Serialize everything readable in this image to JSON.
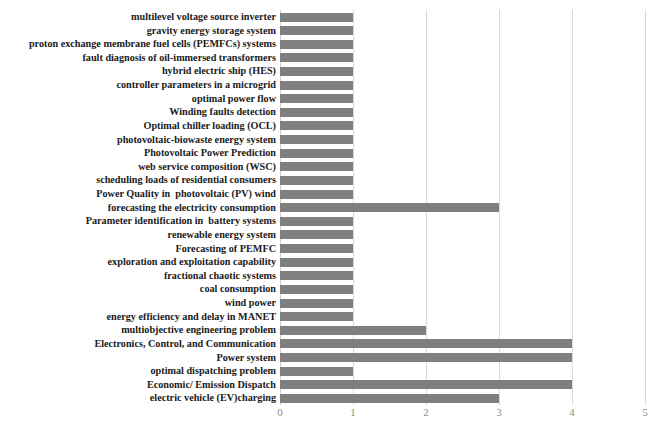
{
  "chart_data": {
    "type": "bar",
    "orientation": "horizontal",
    "title": "",
    "subtitle": "",
    "xlabel": "",
    "ylabel": "",
    "xlim": [
      0,
      5
    ],
    "xticks": [
      "0",
      "1",
      "2",
      "3",
      "4",
      "5"
    ],
    "grid": "vertical",
    "legend": "none",
    "bar_color": "#7f7f7f",
    "gridline_color": "#d9d9d9",
    "tick_label_color": "#8c8c8c",
    "categories": [
      "multilevel voltage source inverter",
      "gravity energy storage system",
      "proton exchange membrane fuel cells (PEMFCs) systems",
      "fault diagnosis of oil-immersed transformers",
      "hybrid electric ship (HES)",
      "controller parameters in a microgrid",
      "optimal power flow",
      "Winding faults detection",
      "Optimal chiller loading (OCL)",
      "photovoltaic-biowaste energy system",
      "Photovoltaic Power Prediction",
      "web service composition (WSC)",
      "scheduling loads of residential consumers",
      "Power Quality in  photovoltaic (PV) wind",
      "forecasting the electricity consumption",
      "Parameter identification in  battery systems",
      "renewable energy system",
      "Forecasting of PEMFC",
      "exploration and exploitation capability",
      "fractional chaotic systems",
      "coal consumption",
      "wind power",
      "energy efficiency and delay in MANET",
      "multiobjective engineering problem",
      "Electronics, Control, and Communication",
      "Power system",
      "optimal dispatching problem",
      "Economic/ Emission Dispatch",
      "electric vehicle (EV)charging"
    ],
    "values": [
      1,
      1,
      1,
      1,
      1,
      1,
      1,
      1,
      1,
      1,
      1,
      1,
      1,
      1,
      3,
      1,
      1,
      1,
      1,
      1,
      1,
      1,
      1,
      2,
      4,
      4,
      1,
      4,
      3
    ]
  }
}
